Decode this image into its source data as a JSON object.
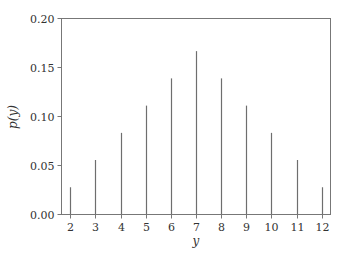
{
  "chart_data": {
    "type": "bar",
    "style": "stem",
    "title": "",
    "xlabel": "y",
    "ylabel": "p(y)",
    "categories": [
      2,
      3,
      4,
      5,
      6,
      7,
      8,
      9,
      10,
      11,
      12
    ],
    "values": [
      0.0278,
      0.0556,
      0.0833,
      0.1111,
      0.1389,
      0.1667,
      0.1389,
      0.1111,
      0.0833,
      0.0556,
      0.0278
    ],
    "xlim": [
      1.65,
      12.35
    ],
    "ylim": [
      0.0,
      0.2
    ],
    "xticks": [
      "2",
      "3",
      "4",
      "5",
      "6",
      "7",
      "8",
      "9",
      "10",
      "11",
      "12"
    ],
    "yticks": [
      "0.00",
      "0.05",
      "0.10",
      "0.15",
      "0.20"
    ],
    "ytick_values": [
      0.0,
      0.05,
      0.1,
      0.15,
      0.2
    ],
    "grid": false,
    "legend": null,
    "colors": {
      "stem": "#6e6e6e",
      "axis": "#777777",
      "text": "#333333"
    }
  }
}
